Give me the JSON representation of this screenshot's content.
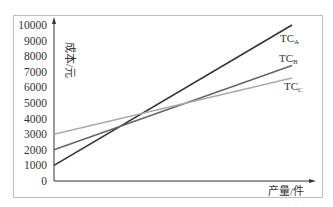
{
  "chart_data": {
    "type": "line",
    "title": "",
    "xlabel": "产量/件",
    "ylabel": "成本/元",
    "ylim": [
      0,
      10000
    ],
    "yticks": [
      0,
      1000,
      2000,
      3000,
      4000,
      5000,
      6000,
      7000,
      8000,
      9000,
      10000
    ],
    "x": [
      0,
      1
    ],
    "grid": false,
    "legend": "inline labels at line ends",
    "series": [
      {
        "name": "TC_A",
        "label_main": "TC",
        "label_sub": "A",
        "color": "#333333",
        "values": [
          1000,
          10000
        ]
      },
      {
        "name": "TC_B",
        "label_main": "TC",
        "label_sub": "B",
        "color": "#666666",
        "values": [
          2000,
          7400
        ]
      },
      {
        "name": "TC_C",
        "label_main": "TC",
        "label_sub": "C",
        "color": "#aaaaaa",
        "values": [
          3000,
          6600
        ]
      }
    ]
  }
}
